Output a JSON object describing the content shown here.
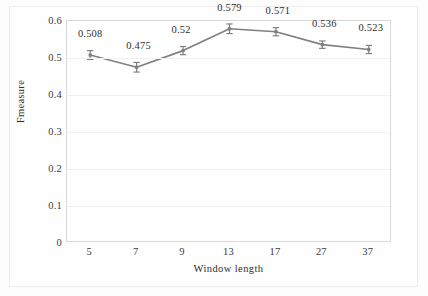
{
  "chart_data": {
    "type": "line",
    "title": "",
    "xlabel": "Window length",
    "ylabel": "Fmeasure",
    "categories": [
      "5",
      "7",
      "9",
      "13",
      "17",
      "27",
      "37"
    ],
    "values": [
      0.508,
      0.475,
      0.52,
      0.579,
      0.571,
      0.536,
      0.523
    ],
    "data_labels": [
      "0.508",
      "0.475",
      "0.52",
      "0.579",
      "0.571",
      "0.536",
      "0.523"
    ],
    "error_bars": [
      0.012,
      0.013,
      0.011,
      0.013,
      0.011,
      0.01,
      0.011
    ],
    "ylim": [
      0,
      0.6
    ],
    "ytick_labels": [
      "0",
      "0.1",
      "0.2",
      "0.3",
      "0.4",
      "0.5",
      "0.6"
    ],
    "ytick_values": [
      0,
      0.1,
      0.2,
      0.3,
      0.4,
      0.5,
      0.6
    ],
    "grid": true,
    "legend": "none",
    "series_color": "#808080",
    "marker": "cross-error-bar",
    "series": [
      {
        "name": "Fmeasure",
        "values": [
          0.508,
          0.475,
          0.52,
          0.579,
          0.571,
          0.536,
          0.523
        ]
      }
    ]
  }
}
